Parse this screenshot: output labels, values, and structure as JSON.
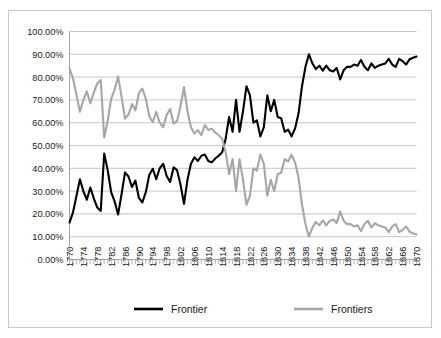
{
  "chart_data": {
    "type": "line",
    "title": "",
    "subtitle": "",
    "xlabel": "",
    "ylabel": "",
    "xlim": [
      1770,
      1870
    ],
    "ylim": [
      0,
      1
    ],
    "grid": true,
    "legend_position": "bottom",
    "y_tick_labels": [
      "100.00%",
      "90.00%",
      "80.00%",
      "70.00%",
      "60.00%",
      "50.00%",
      "40.00%",
      "30.00%",
      "20.00%",
      "10.00%",
      "0.00%"
    ],
    "y_tick_values": [
      1.0,
      0.9,
      0.8,
      0.7,
      0.6,
      0.5,
      0.4,
      0.3,
      0.2,
      0.1,
      0.0
    ],
    "x_tick_labels": [
      "1770",
      "1774",
      "1778",
      "1782",
      "1786",
      "1790",
      "1794",
      "1798",
      "1802",
      "1806",
      "1810",
      "1814",
      "1818",
      "1822",
      "1826",
      "1830",
      "1834",
      "1838",
      "1842",
      "1846",
      "1850",
      "1854",
      "1858",
      "1862",
      "1866",
      "1870"
    ],
    "x_tick_values": [
      1770,
      1774,
      1778,
      1782,
      1786,
      1790,
      1794,
      1798,
      1802,
      1806,
      1810,
      1814,
      1818,
      1822,
      1826,
      1830,
      1834,
      1838,
      1842,
      1846,
      1850,
      1854,
      1858,
      1862,
      1866,
      1870
    ],
    "x": [
      1770,
      1771,
      1772,
      1773,
      1774,
      1775,
      1776,
      1777,
      1778,
      1779,
      1780,
      1781,
      1782,
      1783,
      1784,
      1785,
      1786,
      1787,
      1788,
      1789,
      1790,
      1791,
      1792,
      1793,
      1794,
      1795,
      1796,
      1797,
      1798,
      1799,
      1800,
      1801,
      1802,
      1803,
      1804,
      1805,
      1806,
      1807,
      1808,
      1809,
      1810,
      1811,
      1812,
      1813,
      1814,
      1815,
      1816,
      1817,
      1818,
      1819,
      1820,
      1821,
      1822,
      1823,
      1824,
      1825,
      1826,
      1827,
      1828,
      1829,
      1830,
      1831,
      1832,
      1833,
      1834,
      1835,
      1836,
      1837,
      1838,
      1839,
      1840,
      1841,
      1842,
      1843,
      1844,
      1845,
      1846,
      1847,
      1848,
      1849,
      1850,
      1851,
      1852,
      1853,
      1854,
      1855,
      1856,
      1857,
      1858,
      1859,
      1860,
      1861,
      1862,
      1863,
      1864,
      1865,
      1866,
      1867,
      1868,
      1869,
      1870
    ],
    "series": [
      {
        "name": "Frontier",
        "color": "#000000",
        "width": 2.1,
        "values": [
          0.162,
          0.206,
          0.278,
          0.352,
          0.3,
          0.262,
          0.316,
          0.268,
          0.228,
          0.213,
          0.465,
          0.392,
          0.296,
          0.255,
          0.197,
          0.286,
          0.382,
          0.364,
          0.318,
          0.346,
          0.27,
          0.25,
          0.296,
          0.372,
          0.398,
          0.352,
          0.4,
          0.42,
          0.366,
          0.34,
          0.404,
          0.392,
          0.328,
          0.244,
          0.35,
          0.42,
          0.448,
          0.432,
          0.455,
          0.46,
          0.432,
          0.426,
          0.443,
          0.455,
          0.47,
          0.53,
          0.625,
          0.56,
          0.7,
          0.56,
          0.65,
          0.76,
          0.72,
          0.6,
          0.61,
          0.54,
          0.58,
          0.72,
          0.65,
          0.7,
          0.625,
          0.62,
          0.56,
          0.57,
          0.54,
          0.575,
          0.64,
          0.76,
          0.845,
          0.9,
          0.86,
          0.835,
          0.85,
          0.828,
          0.85,
          0.83,
          0.825,
          0.84,
          0.79,
          0.83,
          0.845,
          0.845,
          0.855,
          0.85,
          0.875,
          0.845,
          0.83,
          0.86,
          0.84,
          0.85,
          0.855,
          0.86,
          0.88,
          0.855,
          0.845,
          0.88,
          0.87,
          0.855,
          0.878,
          0.885,
          0.89
        ]
      },
      {
        "name": "Frontiers",
        "color": "#a6a6a6",
        "width": 2.1,
        "values": [
          0.838,
          0.794,
          0.722,
          0.648,
          0.7,
          0.738,
          0.684,
          0.732,
          0.772,
          0.787,
          0.535,
          0.608,
          0.704,
          0.745,
          0.803,
          0.714,
          0.618,
          0.636,
          0.682,
          0.654,
          0.73,
          0.75,
          0.704,
          0.628,
          0.602,
          0.648,
          0.6,
          0.58,
          0.634,
          0.66,
          0.596,
          0.608,
          0.672,
          0.756,
          0.65,
          0.58,
          0.552,
          0.568,
          0.545,
          0.59,
          0.568,
          0.574,
          0.557,
          0.545,
          0.53,
          0.47,
          0.375,
          0.44,
          0.3,
          0.44,
          0.35,
          0.24,
          0.28,
          0.4,
          0.39,
          0.46,
          0.42,
          0.28,
          0.35,
          0.3,
          0.375,
          0.38,
          0.44,
          0.43,
          0.46,
          0.425,
          0.36,
          0.24,
          0.155,
          0.1,
          0.14,
          0.165,
          0.15,
          0.172,
          0.15,
          0.17,
          0.175,
          0.16,
          0.21,
          0.17,
          0.155,
          0.155,
          0.145,
          0.15,
          0.125,
          0.155,
          0.17,
          0.14,
          0.16,
          0.15,
          0.145,
          0.14,
          0.12,
          0.145,
          0.155,
          0.12,
          0.13,
          0.145,
          0.122,
          0.115,
          0.11
        ]
      }
    ]
  },
  "legend": {
    "items": [
      {
        "label": "Frontier",
        "color": "#000000"
      },
      {
        "label": "Frontiers",
        "color": "#a6a6a6"
      }
    ]
  }
}
